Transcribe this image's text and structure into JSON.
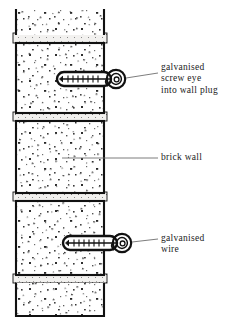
{
  "figure": {
    "background": "#ffffff",
    "ink": "#111111",
    "mortar_color": "#efeeec",
    "brick_face": "#ffffff",
    "size": {
      "width": 241,
      "height": 326
    }
  },
  "wall": {
    "name": "brick wall column",
    "left": 13,
    "right": 107,
    "courses": [
      {
        "id": "course-top-partial",
        "y": 11,
        "height": 80,
        "partial": true,
        "label": "brick (cut off at top)"
      },
      {
        "id": "course-upper",
        "y": 44,
        "height": 68,
        "partial": false,
        "label": "brick"
      },
      {
        "id": "course-middle",
        "y": 120,
        "height": 72,
        "partial": false,
        "label": "brick"
      },
      {
        "id": "course-lower",
        "y": 200,
        "height": 74,
        "partial": false,
        "label": "brick"
      },
      {
        "id": "course-bottom-partial",
        "y": 282,
        "height": 33,
        "partial": true,
        "label": "brick (cut off at bottom)"
      }
    ],
    "mortar_joints": [
      {
        "id": "joint-1",
        "y": 33,
        "height": 9
      },
      {
        "id": "joint-2",
        "y": 112,
        "height": 8
      },
      {
        "id": "joint-3",
        "y": 192,
        "height": 8
      },
      {
        "id": "joint-4",
        "y": 274,
        "height": 8
      }
    ]
  },
  "fixings": [
    {
      "id": "screw-eye-upper",
      "name": "galvanised screw eye into wall plug",
      "plug_x": 57,
      "plug_y": 72,
      "plug_width": 52,
      "plug_height": 13,
      "eye_cx": 115,
      "eye_cy": 79,
      "eye_r": 9,
      "thread_count": 6
    },
    {
      "id": "screw-eye-lower",
      "name": "galvanised screw eye holding wire",
      "plug_x": 63,
      "plug_y": 236,
      "plug_width": 52,
      "plug_height": 13,
      "eye_cx": 121,
      "eye_cy": 243,
      "eye_r": 9,
      "thread_count": 6
    }
  ],
  "callouts": [
    {
      "id": "callout-screw-eye",
      "lines": [
        "galvanised",
        "screw eye",
        "into wall plug"
      ],
      "text_x": 161,
      "text_y": 67,
      "leader": {
        "x1": 126,
        "y1": 79,
        "x2": 158,
        "y2": 74
      }
    },
    {
      "id": "callout-brick-wall",
      "lines": [
        "brick wall"
      ],
      "text_x": 161,
      "text_y": 153,
      "leader": {
        "x1": 62,
        "y1": 158,
        "x2": 158,
        "y2": 158
      }
    },
    {
      "id": "callout-galvanised-wire",
      "lines": [
        "galvanised",
        "wire"
      ],
      "text_x": 161,
      "text_y": 233,
      "leader": {
        "x1": 132,
        "y1": 243,
        "x2": 158,
        "y2": 240
      }
    }
  ],
  "stipple": {
    "description": "random dark specks representing brick aggregate texture",
    "speck_color": "#2b2b2b",
    "density": "medium"
  }
}
